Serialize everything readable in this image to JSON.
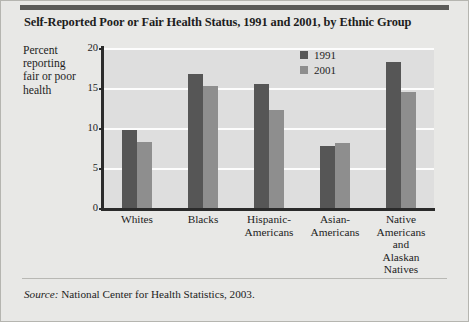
{
  "figure": {
    "title": "Self-Reported Poor or Fair Health Status, 1991 and 2001, by Ethnic Group",
    "source_word": "Source:",
    "source_text": " National Center for Health Statistics, 2003.",
    "background_color": "#e8e8e6",
    "plot_background_color": "#dedede",
    "top_rule_color": "#5a5a58"
  },
  "chart_data": {
    "type": "bar",
    "title": "Self-Reported Poor or Fair Health Status, 1991 and 2001, by Ethnic Group",
    "xlabel": "",
    "ylabel": "Percent reporting fair or poor health",
    "ylabel_lines": [
      "Percent",
      "reporting",
      "fair or poor",
      "health"
    ],
    "categories": [
      "Whites",
      "Hispanic-Americans",
      "Blacks",
      "Asian-Americans",
      "Native Americans and Alaskan Natives"
    ],
    "category_lines": [
      [
        "Whites"
      ],
      [
        "Blacks"
      ],
      [
        "Hispanic-",
        "Americans"
      ],
      [
        "Asian-",
        "Americans"
      ],
      [
        "Native",
        "Americans",
        "and",
        "Alaskan",
        "Natives"
      ]
    ],
    "series": [
      {
        "name": "1991",
        "color": "#565656",
        "values": [
          9.7,
          16.8,
          15.5,
          7.8,
          18.3
        ]
      },
      {
        "name": "2001",
        "color": "#8e8e8e",
        "values": [
          8.2,
          15.3,
          12.3,
          8.1,
          14.5
        ]
      }
    ],
    "ylim": [
      0,
      20
    ],
    "yticks": [
      0,
      5,
      10,
      15,
      20
    ],
    "ytick_labels": [
      "0",
      "5",
      "10",
      "15",
      "20"
    ],
    "grid": true,
    "grid_color": "#fdfdfd",
    "legend_position": "upper right"
  }
}
